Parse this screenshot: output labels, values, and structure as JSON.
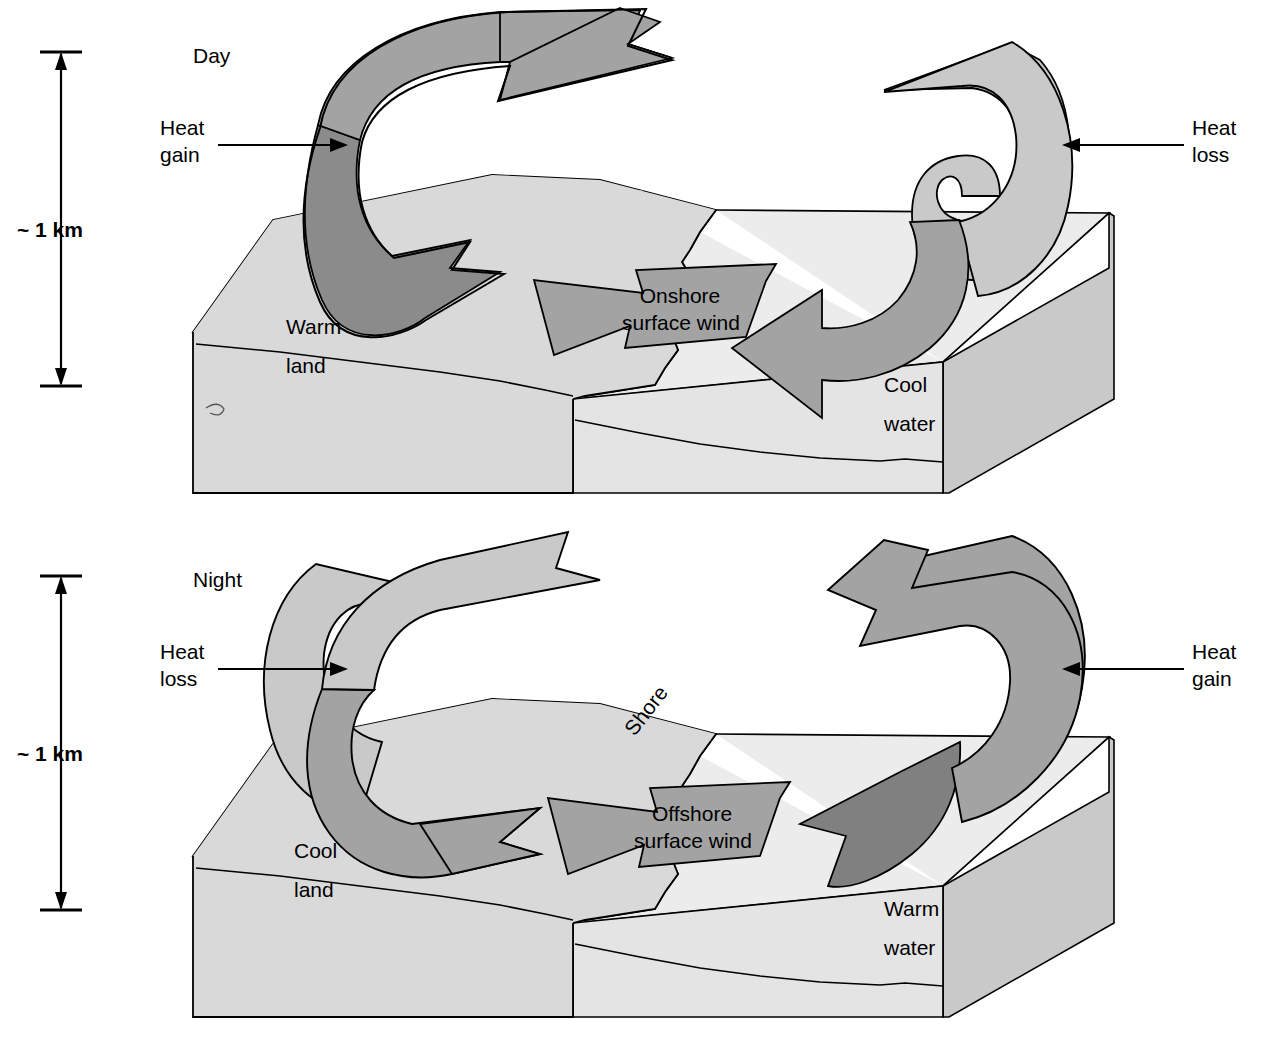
{
  "figure": {
    "kind": "land-sea-breeze-circulation-diagram",
    "panels": [
      {
        "id": "day",
        "title": "Day",
        "scale": {
          "label": "~ 1 km",
          "top_tick": true,
          "bottom_tick": true
        },
        "left_annotation": {
          "line1": "Heat",
          "line2": "gain",
          "arrow": "arrow-right"
        },
        "right_annotation": {
          "line1": "Heat",
          "line2": "loss",
          "arrow": "arrow-left"
        },
        "surface_wind": {
          "line1": "Onshore",
          "line2": "surface wind"
        },
        "land_label": {
          "line1": "Warm",
          "line2": "land"
        },
        "water_label": {
          "line1": "Cool",
          "line2": "water"
        },
        "shore_label": "",
        "rising_side": "land",
        "sinking_side": "water"
      },
      {
        "id": "night",
        "title": "Night",
        "scale": {
          "label": "~ 1 km",
          "top_tick": true,
          "bottom_tick": true
        },
        "left_annotation": {
          "line1": "Heat",
          "line2": "loss",
          "arrow": "arrow-right"
        },
        "right_annotation": {
          "line1": "Heat",
          "line2": "gain",
          "arrow": "arrow-left"
        },
        "surface_wind": {
          "line1": "Offshore",
          "line2": "surface wind"
        },
        "land_label": {
          "line1": "Cool",
          "line2": "land"
        },
        "water_label": {
          "line1": "Warm",
          "line2": "water"
        },
        "shore_label": "Shore",
        "rising_side": "water",
        "sinking_side": "land"
      }
    ],
    "colors": {
      "background": "#ffffff",
      "outline": "#000000",
      "land_top": "#b0b0b0",
      "land_front": "#d7d7d7",
      "land_side": "#c4c4c4",
      "water_top": "#ececec",
      "water_front": "#e2e2e2",
      "water_side": "#cfcfcf",
      "arrow_mid": "#a3a3a3",
      "arrow_dark": "#808080",
      "arrow_light": "#c9c9c9",
      "text": "#000000"
    }
  }
}
